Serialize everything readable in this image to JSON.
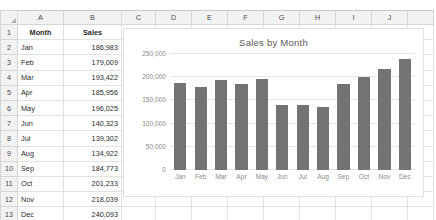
{
  "spreadsheet": {
    "column_headers": [
      "A",
      "B",
      "C",
      "D",
      "E",
      "F",
      "G",
      "H",
      "I",
      "J"
    ],
    "row_numbers": [
      "1",
      "2",
      "3",
      "4",
      "5",
      "6",
      "7",
      "8",
      "9",
      "10",
      "11",
      "12",
      "13",
      "14",
      "15",
      "16"
    ],
    "headers": {
      "month": "Month",
      "sales": "Sales"
    },
    "rows": [
      {
        "month": "Jan",
        "sales": "186,983"
      },
      {
        "month": "Feb",
        "sales": "179,009"
      },
      {
        "month": "Mar",
        "sales": "193,422"
      },
      {
        "month": "Apr",
        "sales": "185,956"
      },
      {
        "month": "May",
        "sales": "196,025"
      },
      {
        "month": "Jun",
        "sales": "140,323"
      },
      {
        "month": "Jul",
        "sales": "139,302"
      },
      {
        "month": "Aug",
        "sales": "134,922"
      },
      {
        "month": "Sep",
        "sales": "184,773"
      },
      {
        "month": "Oct",
        "sales": "201,233"
      },
      {
        "month": "Nov",
        "sales": "218,039"
      },
      {
        "month": "Dec",
        "sales": "240,093"
      }
    ]
  },
  "chart_data": {
    "type": "bar",
    "title": "Sales by Month",
    "xlabel": "",
    "ylabel": "",
    "categories": [
      "Jan",
      "Feb",
      "Mar",
      "Apr",
      "May",
      "Jun",
      "Jul",
      "Aug",
      "Sep",
      "Oct",
      "Nov",
      "Dec"
    ],
    "values": [
      186983,
      179009,
      193422,
      185956,
      196025,
      140323,
      139302,
      134922,
      184773,
      201233,
      218039,
      240093
    ],
    "series": [
      {
        "name": "Sales",
        "values": [
          186983,
          179009,
          193422,
          185956,
          196025,
          140323,
          139302,
          134922,
          184773,
          201233,
          218039,
          240093
        ]
      }
    ],
    "ylim": [
      0,
      250000
    ],
    "yticks": [
      0,
      50000,
      100000,
      150000,
      200000,
      250000
    ],
    "ytick_labels": [
      "0",
      "50,000",
      "100,000",
      "150,000",
      "200,000",
      "250,000"
    ],
    "grid": true,
    "legend": false,
    "bar_color": "#737373"
  },
  "colors": {
    "bar": "#737373",
    "gridline": "#e6e6e6",
    "axis_text": "#8a8a8a",
    "title_text": "#5b5b5b",
    "header_fill": "#f2f2f2",
    "cell_border": "#e2e2e2"
  }
}
